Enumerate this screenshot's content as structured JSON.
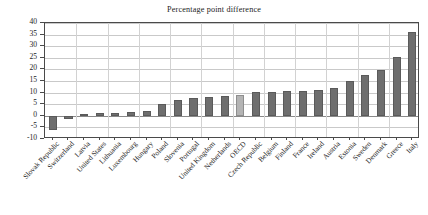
{
  "chart_data": {
    "type": "bar",
    "title": "Percentage point difference",
    "xlabel": "",
    "ylabel": "",
    "ylim": [
      -10,
      40
    ],
    "ytick_step": 5,
    "yticks": [
      -10,
      -5,
      0,
      5,
      10,
      15,
      20,
      25,
      30,
      35,
      40
    ],
    "grid": true,
    "legend": "none",
    "bar_color": "#6e6e6e",
    "highlight_color": "#b4b4b4",
    "highlight_category": "OECD",
    "categories": [
      "Slovak Republic",
      "Switzerland",
      "Latvia",
      "United States",
      "Lithuania",
      "Luxembourg",
      "Hungary",
      "Poland",
      "Slovenia",
      "Portugal",
      "United Kingdom",
      "Netherlands",
      "OECD",
      "Czech Republic",
      "Belgium",
      "Finland",
      "France",
      "Ireland",
      "Austria",
      "Estonia",
      "Sweden",
      "Denmark",
      "Greece",
      "Italy"
    ],
    "values": [
      -6.0,
      -1.5,
      0.7,
      1.0,
      1.3,
      1.6,
      2.2,
      5.2,
      6.6,
      7.6,
      8.0,
      8.7,
      9.0,
      10.2,
      10.4,
      10.5,
      10.6,
      11.3,
      12.1,
      15.2,
      17.8,
      19.6,
      25.4,
      36.2
    ]
  }
}
